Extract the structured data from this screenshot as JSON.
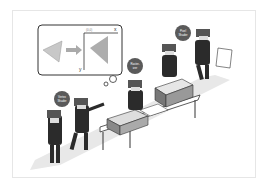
{
  "figure": {
    "type": "illustration",
    "thought_bubble": {
      "axis_x_label": "x",
      "axis_y_label": "y",
      "origin_label": "(0,0)",
      "input_shape": "triangle",
      "output_shape": "rasterized pixel triangle"
    },
    "stages": [
      {
        "label_line1": "Vertex",
        "label_line2": "Shader"
      },
      {
        "label_line1": "Raster-",
        "label_line2": "izer"
      },
      {
        "label_line1": "Pixel",
        "label_line2": "Shader"
      }
    ],
    "colors": {
      "worker": "#2b2b2b",
      "bubble_badge": "#5a5a5a",
      "path": "#e4e4e4",
      "triangle": "#b8b8b8",
      "frame_border": "#e6e6e6"
    }
  },
  "caption": ""
}
